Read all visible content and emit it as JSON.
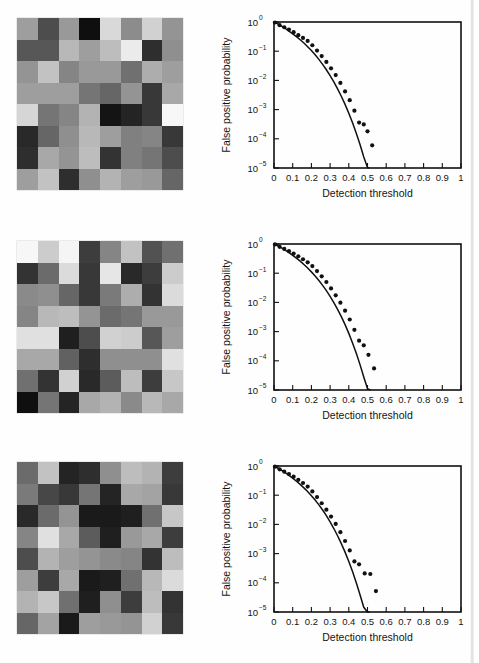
{
  "figure": {
    "panel_count": 3,
    "panels": [
      {
        "id": "a",
        "heatmap_name": "noise-realization-a",
        "heatmap": {
          "rows": 8,
          "cols": 8,
          "values": [
            [
              0.62,
              0.3,
              0.6,
              0.06,
              0.85,
              0.55,
              0.82,
              0.58
            ],
            [
              0.34,
              0.34,
              0.72,
              0.62,
              0.74,
              0.92,
              0.18,
              0.56
            ],
            [
              0.58,
              0.76,
              0.52,
              0.6,
              0.6,
              0.44,
              0.68,
              0.62
            ],
            [
              0.62,
              0.62,
              0.62,
              0.46,
              0.4,
              0.58,
              0.22,
              0.66
            ],
            [
              0.84,
              0.46,
              0.52,
              0.7,
              0.08,
              0.14,
              0.22,
              0.97
            ],
            [
              0.16,
              0.4,
              0.56,
              0.72,
              0.62,
              0.5,
              0.52,
              0.22
            ],
            [
              0.18,
              0.66,
              0.58,
              0.74,
              0.2,
              0.5,
              0.46,
              0.3
            ],
            [
              0.62,
              0.76,
              0.18,
              0.56,
              0.7,
              0.62,
              0.6,
              0.4
            ]
          ]
        }
      },
      {
        "id": "b",
        "heatmap_name": "noise-realization-b",
        "heatmap": {
          "rows": 8,
          "cols": 8,
          "values": [
            [
              0.97,
              0.8,
              0.96,
              0.24,
              0.52,
              0.76,
              0.32,
              0.44
            ],
            [
              0.2,
              0.42,
              0.86,
              0.22,
              0.9,
              0.16,
              0.24,
              0.8
            ],
            [
              0.54,
              0.56,
              0.4,
              0.22,
              0.48,
              0.68,
              0.2,
              0.86
            ],
            [
              0.52,
              0.72,
              0.74,
              0.58,
              0.42,
              0.46,
              0.6,
              0.6
            ],
            [
              0.88,
              0.88,
              0.12,
              0.3,
              0.82,
              0.8,
              0.34,
              0.62
            ],
            [
              0.66,
              0.66,
              0.38,
              0.18,
              0.56,
              0.56,
              0.56,
              0.88
            ],
            [
              0.44,
              0.2,
              0.82,
              0.16,
              0.36,
              0.74,
              0.24,
              0.78
            ],
            [
              0.06,
              0.46,
              0.14,
              0.66,
              0.7,
              0.54,
              0.72,
              0.66
            ]
          ]
        }
      },
      {
        "id": "c",
        "heatmap_name": "noise-realization-c",
        "heatmap": {
          "rows": 8,
          "cols": 8,
          "values": [
            [
              0.42,
              0.76,
              0.14,
              0.18,
              0.56,
              0.74,
              0.7,
              0.24
            ],
            [
              0.48,
              0.28,
              0.22,
              0.46,
              0.14,
              0.66,
              0.64,
              0.22
            ],
            [
              0.16,
              0.42,
              0.58,
              0.1,
              0.1,
              0.12,
              0.44,
              0.78
            ],
            [
              0.52,
              0.88,
              0.66,
              0.36,
              0.12,
              0.6,
              0.66,
              0.24
            ],
            [
              0.3,
              0.7,
              0.62,
              0.58,
              0.54,
              0.52,
              0.2,
              0.74
            ],
            [
              0.62,
              0.24,
              0.66,
              0.1,
              0.12,
              0.44,
              0.72,
              0.86
            ],
            [
              0.7,
              0.78,
              0.44,
              0.12,
              0.56,
              0.24,
              0.74,
              0.2
            ],
            [
              0.4,
              0.64,
              0.1,
              0.62,
              0.6,
              0.58,
              0.82,
              0.22
            ]
          ]
        }
      }
    ]
  },
  "chart_data": [
    {
      "type": "scatter",
      "panel": "a",
      "title": "",
      "xlabel": "Detection threshold",
      "ylabel": "False positive probability",
      "xlim": [
        0,
        1
      ],
      "ylim": [
        1e-05,
        1
      ],
      "yscale": "log",
      "grid": false,
      "legend": null,
      "xticks": [
        0,
        0.1,
        0.2,
        0.3,
        0.4,
        0.5,
        0.6,
        0.7,
        0.8,
        0.9,
        1
      ],
      "xticklabels": [
        "0",
        "0.1",
        "0.2",
        "0.3",
        "0.4",
        "0.5",
        "0.6",
        "0.7",
        "0.8",
        "0.9",
        "1"
      ],
      "yticks": [
        1,
        0.1,
        0.01,
        0.001,
        0.0001,
        1e-05
      ],
      "yticklabels": [
        "10^0",
        "10^-1",
        "10^-2",
        "10^-3",
        "10^-4",
        "10^-5"
      ],
      "series": [
        {
          "name": "theoretical-curve",
          "style": "line",
          "x": [
            0.0,
            0.02,
            0.04,
            0.06,
            0.08,
            0.1,
            0.12,
            0.14,
            0.16,
            0.18,
            0.2,
            0.22,
            0.24,
            0.26,
            0.28,
            0.3,
            0.32,
            0.34,
            0.36,
            0.38,
            0.4,
            0.42,
            0.44,
            0.46,
            0.48,
            0.5,
            0.51
          ],
          "y": [
            1.0,
            0.86,
            0.72,
            0.6,
            0.49,
            0.395,
            0.315,
            0.247,
            0.19,
            0.143,
            0.105,
            0.0755,
            0.0525,
            0.0355,
            0.0232,
            0.0146,
            0.00885,
            0.00515,
            0.00286,
            0.00151,
            0.000755,
            0.000355,
            0.000156,
            6.4e-05,
            2.4e-05,
            1.05e-05,
            1e-05
          ]
        },
        {
          "name": "measured-points",
          "style": "dots",
          "x": [
            0.005,
            0.03,
            0.055,
            0.08,
            0.105,
            0.13,
            0.155,
            0.18,
            0.205,
            0.23,
            0.255,
            0.28,
            0.305,
            0.33,
            0.355,
            0.38,
            0.405,
            0.43,
            0.455,
            0.48,
            0.5,
            0.525
          ],
          "y": [
            0.96,
            0.78,
            0.66,
            0.55,
            0.45,
            0.355,
            0.285,
            0.225,
            0.16,
            0.105,
            0.068,
            0.043,
            0.026,
            0.0152,
            0.0082,
            0.0042,
            0.0021,
            0.00092,
            0.00036,
            0.00031,
            0.00018,
            6e-05
          ]
        }
      ]
    },
    {
      "type": "scatter",
      "panel": "b",
      "title": "",
      "xlabel": "Detection threshold",
      "ylabel": "False positive probability",
      "xlim": [
        0,
        1
      ],
      "ylim": [
        1e-05,
        1
      ],
      "yscale": "log",
      "grid": false,
      "legend": null,
      "xticks": [
        0,
        0.1,
        0.2,
        0.3,
        0.4,
        0.5,
        0.6,
        0.7,
        0.8,
        0.9,
        1
      ],
      "xticklabels": [
        "0",
        "0.1",
        "0.2",
        "0.3",
        "0.4",
        "0.5",
        "0.6",
        "0.7",
        "0.8",
        "0.9",
        "1"
      ],
      "yticks": [
        1,
        0.1,
        0.01,
        0.001,
        0.0001,
        1e-05
      ],
      "yticklabels": [
        "10^0",
        "10^-1",
        "10^-2",
        "10^-3",
        "10^-4",
        "10^-5"
      ],
      "series": [
        {
          "name": "theoretical-curve",
          "style": "line",
          "x": [
            0.0,
            0.02,
            0.04,
            0.06,
            0.08,
            0.1,
            0.12,
            0.14,
            0.16,
            0.18,
            0.2,
            0.22,
            0.24,
            0.26,
            0.28,
            0.3,
            0.32,
            0.34,
            0.36,
            0.38,
            0.4,
            0.42,
            0.44,
            0.46,
            0.48,
            0.5,
            0.515
          ],
          "y": [
            1.0,
            0.87,
            0.74,
            0.62,
            0.51,
            0.41,
            0.33,
            0.26,
            0.199,
            0.15,
            0.111,
            0.08,
            0.0562,
            0.0384,
            0.0253,
            0.0161,
            0.00985,
            0.00578,
            0.00324,
            0.00173,
            0.00087,
            0.00041,
            0.000181,
            7.4e-05,
            2.8e-05,
            1.1e-05,
            1e-05
          ]
        },
        {
          "name": "measured-points",
          "style": "dots",
          "x": [
            0.005,
            0.03,
            0.055,
            0.08,
            0.105,
            0.13,
            0.155,
            0.18,
            0.205,
            0.23,
            0.255,
            0.28,
            0.305,
            0.33,
            0.355,
            0.38,
            0.405,
            0.43,
            0.455,
            0.48,
            0.505,
            0.535
          ],
          "y": [
            0.97,
            0.8,
            0.68,
            0.57,
            0.47,
            0.38,
            0.3,
            0.235,
            0.175,
            0.118,
            0.078,
            0.05,
            0.03,
            0.0175,
            0.0098,
            0.0052,
            0.0026,
            0.00115,
            0.00049,
            0.00034,
            0.00016,
            5.5e-05
          ]
        }
      ]
    },
    {
      "type": "scatter",
      "panel": "c",
      "title": "",
      "xlabel": "Detection threshold",
      "ylabel": "False positive probability",
      "xlim": [
        0,
        1
      ],
      "ylim": [
        1e-05,
        1
      ],
      "yscale": "log",
      "grid": false,
      "legend": null,
      "xticks": [
        0,
        0.1,
        0.2,
        0.3,
        0.4,
        0.5,
        0.6,
        0.7,
        0.8,
        0.9,
        1
      ],
      "xticklabels": [
        "0",
        "0.1",
        "0.2",
        "0.3",
        "0.4",
        "0.5",
        "0.6",
        "0.7",
        "0.8",
        "0.9",
        "1"
      ],
      "yticks": [
        1,
        0.1,
        0.01,
        0.001,
        0.0001,
        1e-05
      ],
      "yticklabels": [
        "10^0",
        "10^-1",
        "10^-2",
        "10^-3",
        "10^-4",
        "10^-5"
      ],
      "series": [
        {
          "name": "theoretical-curve",
          "style": "line",
          "x": [
            0.0,
            0.02,
            0.04,
            0.06,
            0.08,
            0.1,
            0.12,
            0.14,
            0.16,
            0.18,
            0.2,
            0.22,
            0.24,
            0.26,
            0.28,
            0.3,
            0.32,
            0.34,
            0.36,
            0.38,
            0.4,
            0.42,
            0.44,
            0.46,
            0.48,
            0.5,
            0.512
          ],
          "y": [
            1.0,
            0.855,
            0.715,
            0.59,
            0.478,
            0.382,
            0.301,
            0.234,
            0.178,
            0.133,
            0.0965,
            0.0683,
            0.0468,
            0.0311,
            0.0199,
            0.0122,
            0.00722,
            0.00408,
            0.00219,
            0.00112,
            0.00054,
            0.000243,
            0.0001,
            3.9e-05,
            1.45e-05,
            1e-05,
            1e-05
          ]
        },
        {
          "name": "measured-points",
          "style": "dots",
          "x": [
            0.005,
            0.03,
            0.055,
            0.08,
            0.105,
            0.13,
            0.155,
            0.18,
            0.205,
            0.23,
            0.255,
            0.28,
            0.305,
            0.33,
            0.355,
            0.38,
            0.405,
            0.43,
            0.455,
            0.485,
            0.515,
            0.545
          ],
          "y": [
            0.95,
            0.77,
            0.64,
            0.53,
            0.43,
            0.335,
            0.262,
            0.198,
            0.135,
            0.086,
            0.053,
            0.032,
            0.0185,
            0.0104,
            0.0054,
            0.0027,
            0.00128,
            0.00054,
            0.00043,
            0.00021,
            0.0002,
            5.2e-05
          ]
        }
      ]
    }
  ]
}
